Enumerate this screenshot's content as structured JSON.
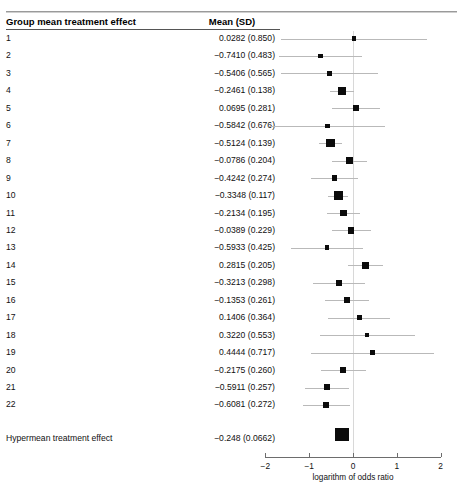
{
  "table": {
    "columns": [
      "Group mean treatment effect",
      "Mean (SD)"
    ],
    "rows": [
      {
        "label": "1",
        "value": "0.0282 (0.850)",
        "mean": 0.0282,
        "sd": 0.85
      },
      {
        "label": "2",
        "value": "−0.7410 (0.483)",
        "mean": -0.741,
        "sd": 0.483
      },
      {
        "label": "3",
        "value": "−0.5406 (0.565)",
        "mean": -0.5406,
        "sd": 0.565
      },
      {
        "label": "4",
        "value": "−0.2461 (0.138)",
        "mean": -0.2461,
        "sd": 0.138
      },
      {
        "label": "5",
        "value": "0.0695 (0.281)",
        "mean": 0.0695,
        "sd": 0.281
      },
      {
        "label": "6",
        "value": "−0.5842 (0.676)",
        "mean": -0.5842,
        "sd": 0.676
      },
      {
        "label": "7",
        "value": "−0.5124 (0.139)",
        "mean": -0.5124,
        "sd": 0.139
      },
      {
        "label": "8",
        "value": "−0.0786 (0.204)",
        "mean": -0.0786,
        "sd": 0.204
      },
      {
        "label": "9",
        "value": "−0.4242 (0.274)",
        "mean": -0.4242,
        "sd": 0.274
      },
      {
        "label": "10",
        "value": "−0.3348 (0.117)",
        "mean": -0.3348,
        "sd": 0.117
      },
      {
        "label": "11",
        "value": "−0.2134 (0.195)",
        "mean": -0.2134,
        "sd": 0.195
      },
      {
        "label": "12",
        "value": "−0.0389 (0.229)",
        "mean": -0.0389,
        "sd": 0.229
      },
      {
        "label": "13",
        "value": "−0.5933 (0.425)",
        "mean": -0.5933,
        "sd": 0.425
      },
      {
        "label": "14",
        "value": "0.2815 (0.205)",
        "mean": 0.2815,
        "sd": 0.205
      },
      {
        "label": "15",
        "value": "−0.3213 (0.298)",
        "mean": -0.3213,
        "sd": 0.298
      },
      {
        "label": "16",
        "value": "−0.1353 (0.261)",
        "mean": -0.1353,
        "sd": 0.261
      },
      {
        "label": "17",
        "value": "0.1406 (0.364)",
        "mean": 0.1406,
        "sd": 0.364
      },
      {
        "label": "18",
        "value": "0.3220 (0.553)",
        "mean": 0.322,
        "sd": 0.553
      },
      {
        "label": "19",
        "value": "0.4444 (0.717)",
        "mean": 0.4444,
        "sd": 0.717
      },
      {
        "label": "20",
        "value": "−0.2175 (0.260)",
        "mean": -0.2175,
        "sd": 0.26
      },
      {
        "label": "21",
        "value": "−0.5911 (0.257)",
        "mean": -0.5911,
        "sd": 0.257
      },
      {
        "label": "22",
        "value": "−0.6081 (0.272)",
        "mean": -0.6081,
        "sd": 0.272
      }
    ],
    "summary": {
      "label": "Hypermean treatment effect",
      "value": "−0.248 (0.0662)",
      "mean": -0.248,
      "sd": 0.0662
    }
  },
  "axis": {
    "title": "logarithm of odds ratio",
    "ticks": [
      "−2",
      "−1",
      "0",
      "1",
      "2"
    ],
    "tick_values": [
      -2,
      -1,
      0,
      1,
      2
    ],
    "min": -2,
    "max": 2
  },
  "artifacts": {
    "page_number": "",
    "caption": ""
  },
  "chart_data": {
    "type": "forest",
    "title": "",
    "xlabel": "logarithm of odds ratio",
    "ylabel": "Group mean treatment effect",
    "xlim": [
      -2,
      2
    ],
    "xticks": [
      -2,
      -1,
      0,
      1,
      2
    ],
    "grid": false,
    "reference_line": 0,
    "marker_color": "#0b0b0b",
    "ci_color": "#b9b9b9",
    "categories": [
      "1",
      "2",
      "3",
      "4",
      "5",
      "6",
      "7",
      "8",
      "9",
      "10",
      "11",
      "12",
      "13",
      "14",
      "15",
      "16",
      "17",
      "18",
      "19",
      "20",
      "21",
      "22",
      "Hypermean treatment effect"
    ],
    "means": [
      0.0282,
      -0.741,
      -0.5406,
      -0.2461,
      0.0695,
      -0.5842,
      -0.5124,
      -0.0786,
      -0.4242,
      -0.3348,
      -0.2134,
      -0.0389,
      -0.5933,
      0.2815,
      -0.3213,
      -0.1353,
      0.1406,
      0.322,
      0.4444,
      -0.2175,
      -0.5911,
      -0.6081,
      -0.248
    ],
    "sds": [
      0.85,
      0.483,
      0.565,
      0.138,
      0.281,
      0.676,
      0.139,
      0.204,
      0.274,
      0.117,
      0.195,
      0.229,
      0.425,
      0.205,
      0.298,
      0.261,
      0.364,
      0.553,
      0.717,
      0.26,
      0.257,
      0.272,
      0.0662
    ],
    "ci_multiplier": 1.96,
    "summary_index": 22
  }
}
